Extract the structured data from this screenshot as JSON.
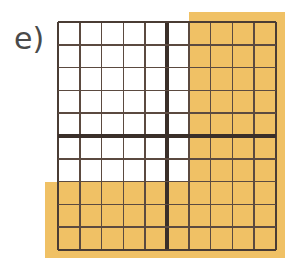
{
  "figure": {
    "label": "e)",
    "type": "fraction-area-grid"
  },
  "colors": {
    "shade": "#f0c165",
    "grid_line": "#5b4a40",
    "bold_line": "#3a2f29",
    "background": "#ffffff",
    "label_text": "#4a4a4a"
  },
  "grid": {
    "columns": 10,
    "rows": 10,
    "cell_size_px": 21.8,
    "bold_divider_after_column": 5,
    "bold_divider_after_row": 5,
    "shaded_columns": [
      7,
      8,
      9,
      10
    ],
    "shaded_rows": [
      8,
      9,
      10
    ],
    "shaded_cell_count": 58,
    "total_cell_count": 100,
    "shaded_fraction": "58/100",
    "cells": [
      [
        0,
        0,
        0,
        0,
        0,
        0,
        1,
        1,
        1,
        1
      ],
      [
        0,
        0,
        0,
        0,
        0,
        0,
        1,
        1,
        1,
        1
      ],
      [
        0,
        0,
        0,
        0,
        0,
        0,
        1,
        1,
        1,
        1
      ],
      [
        0,
        0,
        0,
        0,
        0,
        0,
        1,
        1,
        1,
        1
      ],
      [
        0,
        0,
        0,
        0,
        0,
        0,
        1,
        1,
        1,
        1
      ],
      [
        0,
        0,
        0,
        0,
        0,
        0,
        1,
        1,
        1,
        1
      ],
      [
        0,
        0,
        0,
        0,
        0,
        0,
        1,
        1,
        1,
        1
      ],
      [
        1,
        1,
        1,
        1,
        1,
        1,
        1,
        1,
        1,
        1
      ],
      [
        1,
        1,
        1,
        1,
        1,
        1,
        1,
        1,
        1,
        1
      ],
      [
        1,
        1,
        1,
        1,
        1,
        1,
        1,
        1,
        1,
        1
      ]
    ]
  },
  "wash": {
    "top_overhang_px": 10,
    "right_overhang_px": 9,
    "bottom_overhang_px": 8,
    "left_overhang_px": 13
  }
}
